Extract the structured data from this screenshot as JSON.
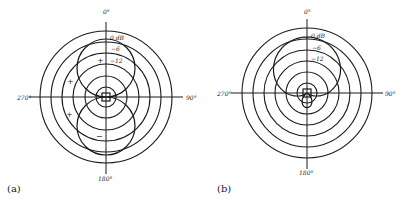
{
  "figure": {
    "panels": [
      {
        "id": "a",
        "caption": "(a)",
        "pattern": "figure-8",
        "center": [
          106,
          97
        ],
        "ring_radii": [
          10,
          21,
          33,
          44,
          55,
          66
        ],
        "axis_extent": 77,
        "angle_labels": {
          "top": "0°",
          "right": "90°",
          "bottom": "180°",
          "left": "270°"
        },
        "level_labels": [
          "0 dB",
          "−6",
          "−12"
        ],
        "signs": [
          {
            "text": "+",
            "x": 99,
            "y": 62
          },
          {
            "text": "+",
            "x": 69,
            "y": 83
          },
          {
            "text": "+",
            "x": 68,
            "y": 116
          },
          {
            "text": "−",
            "x": 97,
            "y": 138
          }
        ]
      },
      {
        "id": "b",
        "caption": "(b)",
        "pattern": "supercardioid",
        "center": [
          307,
          93
        ],
        "ring_radii": [
          10,
          21,
          32,
          43,
          54,
          65
        ],
        "axis_extent": 76,
        "angle_labels": {
          "top": "0°",
          "right": "90°",
          "bottom": "180°",
          "left": "270°"
        },
        "level_labels": [
          "0 dB",
          "−6",
          "−12"
        ]
      }
    ]
  },
  "chart_data": [
    {
      "type": "polar",
      "title": "(a) Figure-8 (bidirectional) polar pattern",
      "angle_ticks": [
        "0°",
        "90°",
        "180°",
        "270°"
      ],
      "level_rings_db": [
        "0 dB",
        "−6",
        "−12"
      ],
      "lobes": [
        {
          "direction": "0°",
          "polarity": "+"
        },
        {
          "direction": "180°",
          "polarity": "−"
        }
      ]
    },
    {
      "type": "polar",
      "title": "(b) Supercardioid polar pattern",
      "angle_ticks": [
        "0°",
        "90°",
        "180°",
        "270°"
      ],
      "level_rings_db": [
        "0 dB",
        "−6",
        "−12"
      ]
    }
  ]
}
